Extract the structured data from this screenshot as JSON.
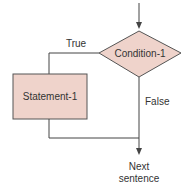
{
  "diagram": {
    "type": "flowchart",
    "nodes": {
      "condition": {
        "shape": "diamond",
        "label": "Condition-1"
      },
      "statement": {
        "shape": "rectangle",
        "label": "Statement-1"
      },
      "next": {
        "shape": "terminal-text",
        "label_line1": "Next",
        "label_line2": "sentence"
      }
    },
    "edges": {
      "true_label": "True",
      "false_label": "False"
    },
    "colors": {
      "fill": "#efd3cb",
      "stroke": "#555555",
      "text": "#333333"
    }
  }
}
